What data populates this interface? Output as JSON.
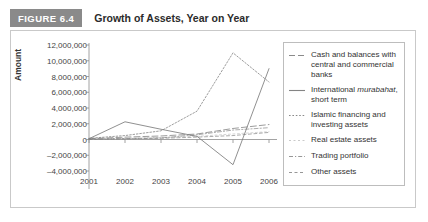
{
  "figure": {
    "badge": "FIGURE 6.4",
    "title": "Growth of Assets, Year on Year"
  },
  "chart_data": {
    "type": "line",
    "title": "Growth of Assets, Year on Year",
    "xlabel": "",
    "ylabel": "Amount",
    "x": [
      "2001",
      "2002",
      "2003",
      "2004",
      "2005",
      "2006"
    ],
    "categories": [
      "2001",
      "2002",
      "2003",
      "2004",
      "2005",
      "2006"
    ],
    "ylim": [
      -4000000,
      12000000
    ],
    "ytick_labels": [
      "12,000,000",
      "10,000,000",
      "8,000,000",
      "6,000,000",
      "4,000,000",
      "2,000,000",
      "0",
      "–2,000,000",
      "–4,000,000"
    ],
    "ytick_values": [
      12000000,
      10000000,
      8000000,
      6000000,
      4000000,
      2000000,
      0,
      -2000000,
      -4000000
    ],
    "grid": false,
    "legend_position": "right",
    "series": [
      {
        "name": "Cash and balances with central and commercial banks",
        "style": "long-dash",
        "values": [
          100000,
          300000,
          450000,
          700000,
          1400000,
          1900000
        ]
      },
      {
        "name": "International murabahat, short term",
        "style": "solid",
        "values": [
          100000,
          2250000,
          1300000,
          400000,
          -3200000,
          9000000
        ]
      },
      {
        "name": "Islamic financing and investing assets",
        "style": "dotted",
        "values": [
          150000,
          500000,
          1100000,
          3600000,
          11000000,
          7300000
        ]
      },
      {
        "name": "Real estate assets",
        "style": "faint",
        "values": [
          60000,
          150000,
          250000,
          400000,
          700000,
          1000000
        ]
      },
      {
        "name": "Trading portfolio",
        "style": "dash-dot",
        "values": [
          50000,
          120000,
          200000,
          600000,
          1200000,
          1500000
        ]
      },
      {
        "name": "Other assets",
        "style": "short-dash",
        "values": [
          30000,
          80000,
          150000,
          300000,
          500000,
          900000
        ]
      }
    ]
  },
  "legend": {
    "items": [
      {
        "key": "long-dash",
        "label": "Cash and balances with central and commercial banks",
        "italic_word": ""
      },
      {
        "key": "solid",
        "label": "International murabahat, short term",
        "italic_word": "murabahat"
      },
      {
        "key": "dotted",
        "label": "Islamic financing and investing assets",
        "italic_word": ""
      },
      {
        "key": "faint",
        "label": "Real estate assets",
        "italic_word": ""
      },
      {
        "key": "dash-dot",
        "label": "Trading portfolio",
        "italic_word": ""
      },
      {
        "key": "short-dash",
        "label": "Other assets",
        "italic_word": ""
      }
    ]
  },
  "colors": {
    "badge_bg": "#8a8a8a",
    "line": "#7d7d7d",
    "axis": "#8c8c8c",
    "panel_border": "#c9c9c9",
    "text": "#333333"
  }
}
